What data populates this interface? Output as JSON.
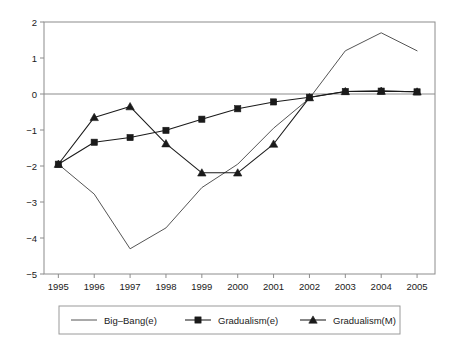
{
  "chart_data": {
    "type": "line",
    "title": "",
    "subtitle": "",
    "xlabel": "",
    "ylabel": "",
    "x": [
      1995,
      1996,
      1997,
      1998,
      1999,
      2000,
      2001,
      2002,
      2003,
      2004,
      2005
    ],
    "categories": [
      "1995",
      "1996",
      "1997",
      "1998",
      "1999",
      "2000",
      "2001",
      "2002",
      "2003",
      "2004",
      "2005"
    ],
    "xlim": [
      1994.6,
      2005.5
    ],
    "ylim": [
      -5,
      2
    ],
    "yticks": [
      -5,
      -4,
      -3,
      -2,
      -1,
      0,
      1,
      2
    ],
    "ytick_labels": [
      "-5",
      "-4",
      "-3",
      "-2",
      "-1",
      "0",
      "1",
      "2"
    ],
    "grid": false,
    "zero_line": true,
    "legend_position": "bottom",
    "series": [
      {
        "name": "Big-Bang(e)",
        "label": "Big–Bang(e)",
        "marker": "none",
        "color": "#555555",
        "values": [
          -1.95,
          -2.78,
          -4.3,
          -3.72,
          -2.6,
          -1.95,
          -0.95,
          -0.12,
          1.2,
          1.7,
          1.2
        ]
      },
      {
        "name": "Gradualism(e)",
        "label": "Gradualism(e)",
        "marker": "square",
        "color": "#1a1a1a",
        "values": [
          -1.95,
          -1.34,
          -1.21,
          -1.01,
          -0.7,
          -0.41,
          -0.22,
          -0.09,
          0.07,
          0.08,
          0.06
        ]
      },
      {
        "name": "Gradualism(M)",
        "label": "Gradualism(M)",
        "marker": "triangle",
        "color": "#1a1a1a",
        "values": [
          -1.95,
          -0.65,
          -0.35,
          -1.38,
          -2.19,
          -2.19,
          -1.39,
          -0.1,
          0.07,
          0.08,
          0.06
        ]
      }
    ]
  },
  "axes": {
    "y_tick_labels": [
      "2",
      "1",
      "0",
      "-1",
      "-2",
      "-3",
      "-4",
      "-5"
    ],
    "x_tick_labels": [
      "1995",
      "1996",
      "1997",
      "1998",
      "1999",
      "2000",
      "2001",
      "2002",
      "2003",
      "2004",
      "2005"
    ]
  },
  "legend": {
    "entries": [
      {
        "label": "Big–Bang(e)",
        "marker": "none"
      },
      {
        "label": "Gradualism(e)",
        "marker": "square"
      },
      {
        "label": "Gradualism(M)",
        "marker": "triangle"
      }
    ]
  },
  "colors": {
    "axis": "#8c8c8c",
    "line_bigbang": "#555555",
    "line_marker_series": "#1a1a1a",
    "text": "#1a1a1a",
    "background": "#ffffff",
    "legend_border": "#9a9a9a"
  }
}
